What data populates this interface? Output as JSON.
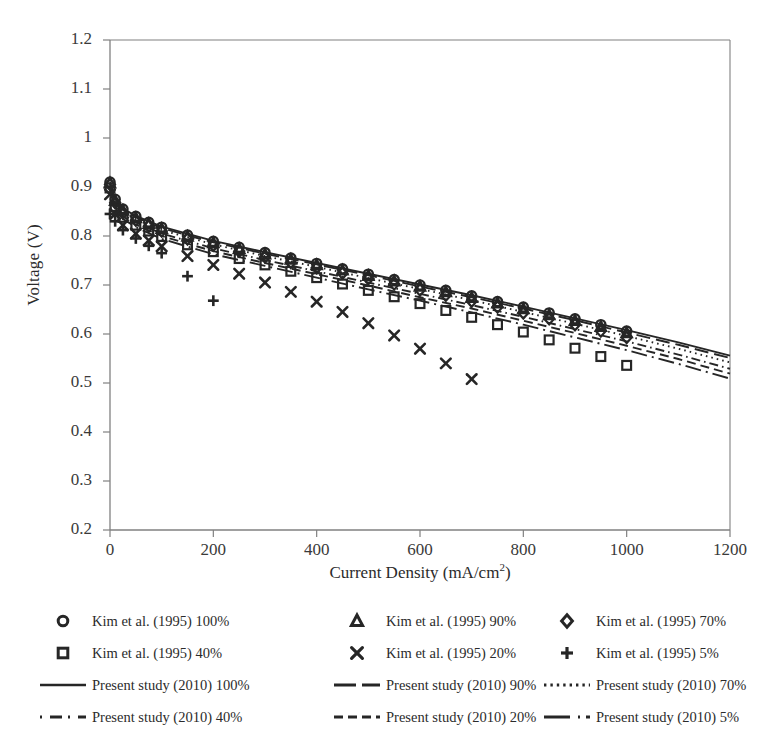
{
  "chart_data": {
    "type": "line",
    "title": "",
    "xlabel": "Current Density (mA/cm2)",
    "xlabel_main": "Current Density (mA/cm",
    "xlabel_sup": "2",
    "xlabel_tail": ")",
    "ylabel": "Voltage (V)",
    "xlim": [
      0,
      1200
    ],
    "ylim": [
      0.2,
      1.2
    ],
    "xticks": [
      0,
      200,
      400,
      600,
      800,
      1000,
      1200
    ],
    "yticks": [
      "0.2",
      "0.3",
      "0.4",
      "0.5",
      "0.6",
      "0.7",
      "0.8",
      "0.9",
      "1",
      "1.1",
      "1.2"
    ],
    "grid": false,
    "legend_position": "bottom",
    "line_color": "#262626",
    "marker_color": "#262626",
    "axis_color": "#808080",
    "series": [
      {
        "name": "Kim et al. (1995) 100%",
        "kind": "markers",
        "marker": "circle",
        "x": [
          0,
          10,
          25,
          50,
          75,
          100,
          150,
          200,
          250,
          300,
          350,
          400,
          450,
          500,
          550,
          600,
          650,
          700,
          750,
          800,
          850,
          900,
          950,
          1000
        ],
        "y": [
          0.91,
          0.875,
          0.855,
          0.84,
          0.828,
          0.818,
          0.802,
          0.789,
          0.777,
          0.766,
          0.755,
          0.744,
          0.733,
          0.722,
          0.711,
          0.7,
          0.689,
          0.678,
          0.666,
          0.655,
          0.643,
          0.631,
          0.619,
          0.606
        ]
      },
      {
        "name": "Kim et al. (1995) 90%",
        "kind": "markers",
        "marker": "triangle",
        "x": [
          0,
          10,
          25,
          50,
          75,
          100,
          150,
          200,
          250,
          300,
          350,
          400,
          450,
          500,
          550,
          600,
          650,
          700,
          750,
          800,
          850,
          900,
          950,
          1000
        ],
        "y": [
          0.908,
          0.872,
          0.852,
          0.837,
          0.825,
          0.815,
          0.799,
          0.786,
          0.774,
          0.763,
          0.752,
          0.741,
          0.73,
          0.719,
          0.708,
          0.697,
          0.686,
          0.674,
          0.663,
          0.651,
          0.639,
          0.627,
          0.615,
          0.602
        ]
      },
      {
        "name": "Kim et al. (1995) 70%",
        "kind": "markers",
        "marker": "diamond",
        "x": [
          0,
          10,
          25,
          50,
          75,
          100,
          150,
          200,
          250,
          300,
          350,
          400,
          450,
          500,
          550,
          600,
          650,
          700,
          750,
          800,
          850,
          900,
          950,
          1000
        ],
        "y": [
          0.905,
          0.868,
          0.847,
          0.832,
          0.82,
          0.81,
          0.794,
          0.781,
          0.769,
          0.757,
          0.746,
          0.735,
          0.724,
          0.713,
          0.702,
          0.69,
          0.679,
          0.667,
          0.655,
          0.643,
          0.631,
          0.619,
          0.606,
          0.593
        ]
      },
      {
        "name": "Kim et al. (1995) 40%",
        "kind": "markers",
        "marker": "square",
        "x": [
          0,
          10,
          25,
          50,
          75,
          100,
          150,
          200,
          250,
          300,
          350,
          400,
          450,
          500,
          550,
          600,
          650,
          700,
          750,
          800,
          850,
          900,
          950,
          1000
        ],
        "y": [
          0.898,
          0.86,
          0.838,
          0.822,
          0.81,
          0.799,
          0.782,
          0.768,
          0.754,
          0.741,
          0.728,
          0.715,
          0.702,
          0.689,
          0.676,
          0.662,
          0.648,
          0.634,
          0.619,
          0.604,
          0.588,
          0.571,
          0.554,
          0.536
        ]
      },
      {
        "name": "Kim et al. (1995) 20%",
        "kind": "markers",
        "marker": "cross",
        "x": [
          0,
          10,
          25,
          50,
          75,
          100,
          150,
          200,
          250,
          300,
          350,
          400,
          450,
          500,
          550,
          600,
          650,
          700
        ],
        "y": [
          0.885,
          0.845,
          0.822,
          0.805,
          0.791,
          0.779,
          0.759,
          0.741,
          0.723,
          0.705,
          0.686,
          0.666,
          0.645,
          0.622,
          0.597,
          0.57,
          0.54,
          0.508
        ]
      },
      {
        "name": "Kim et al. (1995) 5%",
        "kind": "markers",
        "marker": "plus",
        "x": [
          0,
          10,
          25,
          50,
          75,
          100,
          150,
          200
        ],
        "y": [
          0.845,
          0.83,
          0.812,
          0.795,
          0.78,
          0.765,
          0.718,
          0.668
        ]
      },
      {
        "name": "Present study (2010) 100%",
        "kind": "line",
        "dash": "solid",
        "x": [
          0,
          10,
          25,
          50,
          100,
          200,
          300,
          400,
          500,
          600,
          700,
          800,
          900,
          1000,
          1100,
          1200
        ],
        "y": [
          0.91,
          0.876,
          0.856,
          0.841,
          0.819,
          0.79,
          0.767,
          0.745,
          0.723,
          0.701,
          0.679,
          0.656,
          0.632,
          0.608,
          0.583,
          0.556
        ]
      },
      {
        "name": "Present study (2010) 90%",
        "kind": "line",
        "dash": "longdash",
        "x": [
          0,
          10,
          25,
          50,
          100,
          200,
          300,
          400,
          500,
          600,
          700,
          800,
          900,
          1000,
          1100,
          1200
        ],
        "y": [
          0.908,
          0.873,
          0.853,
          0.838,
          0.816,
          0.787,
          0.764,
          0.742,
          0.72,
          0.697,
          0.675,
          0.652,
          0.628,
          0.603,
          0.578,
          0.551
        ]
      },
      {
        "name": "Present study (2010) 70%",
        "kind": "line",
        "dash": "dotted",
        "x": [
          0,
          10,
          25,
          50,
          100,
          200,
          300,
          400,
          500,
          600,
          700,
          800,
          900,
          1000,
          1100,
          1200
        ],
        "y": [
          0.906,
          0.87,
          0.849,
          0.834,
          0.812,
          0.783,
          0.759,
          0.737,
          0.714,
          0.692,
          0.669,
          0.645,
          0.621,
          0.596,
          0.57,
          0.542
        ]
      },
      {
        "name": "Present study (2010) 40%",
        "kind": "line",
        "dash": "dashdot",
        "x": [
          0,
          10,
          25,
          50,
          100,
          200,
          300,
          400,
          500,
          600,
          700,
          800,
          900,
          1000,
          1100,
          1200
        ],
        "y": [
          0.902,
          0.865,
          0.844,
          0.828,
          0.805,
          0.775,
          0.751,
          0.728,
          0.705,
          0.682,
          0.659,
          0.635,
          0.61,
          0.585,
          0.558,
          0.529
        ]
      },
      {
        "name": "Present study (2010) 20%",
        "kind": "line",
        "dash": "dashed",
        "x": [
          0,
          10,
          25,
          50,
          100,
          200,
          300,
          400,
          500,
          600,
          700,
          800,
          900,
          1000,
          1100,
          1200
        ],
        "y": [
          0.899,
          0.861,
          0.84,
          0.823,
          0.8,
          0.769,
          0.745,
          0.722,
          0.699,
          0.675,
          0.652,
          0.627,
          0.602,
          0.576,
          0.549,
          0.519
        ]
      },
      {
        "name": "Present study (2010) 5%",
        "kind": "line",
        "dash": "longdashdot",
        "x": [
          0,
          10,
          25,
          50,
          100,
          200,
          300,
          400,
          500,
          600,
          700,
          800,
          900,
          1000,
          1100,
          1200
        ],
        "y": [
          0.896,
          0.857,
          0.835,
          0.818,
          0.794,
          0.763,
          0.739,
          0.715,
          0.691,
          0.668,
          0.644,
          0.619,
          0.593,
          0.567,
          0.539,
          0.509
        ]
      }
    ]
  },
  "axes": {
    "y_title": "Voltage (V)",
    "x_title_main": "Current Density (mA/cm",
    "x_title_sup": "2",
    "x_title_tail": ")",
    "yticks": [
      "1.2",
      "1.1",
      "1",
      "0.9",
      "0.8",
      "0.7",
      "0.6",
      "0.5",
      "0.4",
      "0.3",
      "0.2"
    ],
    "xticks": [
      "0",
      "200",
      "400",
      "600",
      "800",
      "1000",
      "1200"
    ]
  },
  "legend": {
    "items": [
      {
        "label": "Kim et al. (1995) 100%",
        "symbol": "circle-marker",
        "row": 0,
        "col": 0
      },
      {
        "label": "Kim et al. (1995) 90%",
        "symbol": "triangle-marker",
        "row": 0,
        "col": 1
      },
      {
        "label": "Kim et al. (1995) 70%",
        "symbol": "diamond-marker",
        "row": 0,
        "col": 2
      },
      {
        "label": "Kim et al. (1995) 40%",
        "symbol": "square-marker",
        "row": 1,
        "col": 0
      },
      {
        "label": "Kim et al. (1995) 20%",
        "symbol": "cross-marker",
        "row": 1,
        "col": 1
      },
      {
        "label": "Kim et al. (1995) 5%",
        "symbol": "plus-marker",
        "row": 1,
        "col": 2
      },
      {
        "label": "Present study (2010) 100%",
        "symbol": "solid-line",
        "row": 2,
        "col": 0
      },
      {
        "label": "Present study (2010) 90%",
        "symbol": "longdash-line",
        "row": 2,
        "col": 1
      },
      {
        "label": "Present study (2010) 70%",
        "symbol": "dotted-line",
        "row": 2,
        "col": 2
      },
      {
        "label": "Present study (2010) 40%",
        "symbol": "dashdot-line",
        "row": 3,
        "col": 0
      },
      {
        "label": "Present study (2010) 20%",
        "symbol": "dashed-line",
        "row": 3,
        "col": 1
      },
      {
        "label": "Present study (2010) 5%",
        "symbol": "longdashdot-line",
        "row": 3,
        "col": 2
      }
    ]
  }
}
